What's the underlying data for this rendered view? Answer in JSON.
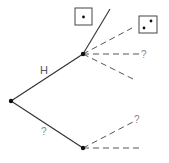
{
  "diagram": {
    "type": "tree",
    "nodes": [
      {
        "id": "root",
        "x": 11,
        "y": 101
      },
      {
        "id": "upper",
        "x": 83,
        "y": 54
      },
      {
        "id": "lower",
        "x": 83,
        "y": 148
      }
    ],
    "edges": [
      {
        "from": "root",
        "to": "upper",
        "label": "H",
        "style": "solid"
      },
      {
        "from": "root",
        "to": "lower",
        "label": "?",
        "style": "solid"
      },
      {
        "from": "upper",
        "to": [
          110,
          9
        ],
        "style": "solid"
      },
      {
        "from": "upper",
        "to": [
          132,
          28
        ],
        "style": "dashed"
      },
      {
        "from": "upper",
        "to": [
          139,
          54
        ],
        "label": "?",
        "style": "dashed"
      },
      {
        "from": "upper",
        "to": [
          133,
          79
        ],
        "style": "dashed"
      },
      {
        "from": "lower",
        "to": [
          133,
          122
        ],
        "label": "?",
        "style": "dashed"
      },
      {
        "from": "lower",
        "to": [
          139,
          148
        ],
        "style": "dashed"
      }
    ],
    "labels": {
      "edge_h": "H",
      "edge_lower": "?",
      "upper_mid": "?",
      "lower_top": "?"
    },
    "dice": [
      {
        "name": "die-one",
        "pips": 1
      },
      {
        "name": "die-two",
        "pips": 2
      }
    ],
    "colors": {
      "line": "#333333",
      "dash": "#555555",
      "text": "#555555"
    }
  }
}
